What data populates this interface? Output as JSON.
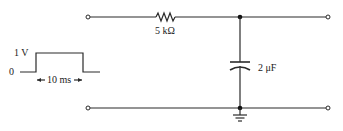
{
  "diagram": {
    "type": "RC low-pass circuit with pulse input",
    "input_pulse": {
      "high_label": "1 V",
      "low_label": "0",
      "width_label": "10 ms"
    },
    "resistor": {
      "label": "5 kΩ"
    },
    "capacitor": {
      "label": "2 μF"
    },
    "colors": {
      "line": "#2a2a2a",
      "background": "#ffffff"
    }
  }
}
